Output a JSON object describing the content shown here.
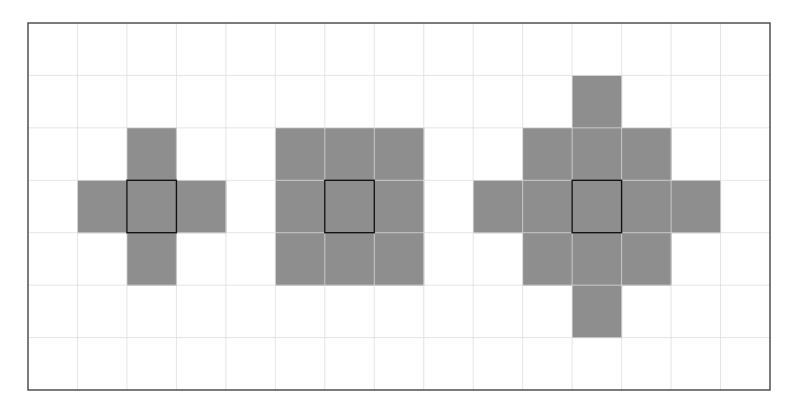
{
  "diagram": {
    "title": "",
    "grid": {
      "columns": 15,
      "rows": 7
    },
    "colors": {
      "background": "#ffffff",
      "grid_line": "#dcdcdc",
      "border": "#444444",
      "filled_cell": "#8e8e8e",
      "center_outline": "#111111"
    },
    "shapes": [
      {
        "name": "cross-neighborhood",
        "description": "4-neighborhood (Manhattan distance 1)",
        "center": {
          "col": 2,
          "row": 3
        },
        "cells": [
          [
            2,
            2
          ],
          [
            1,
            3
          ],
          [
            2,
            3
          ],
          [
            3,
            3
          ],
          [
            2,
            4
          ]
        ]
      },
      {
        "name": "square-neighborhood",
        "description": "8-neighborhood (Chebyshev distance 1)",
        "center": {
          "col": 6,
          "row": 3
        },
        "cells": [
          [
            5,
            2
          ],
          [
            6,
            2
          ],
          [
            7,
            2
          ],
          [
            5,
            3
          ],
          [
            6,
            3
          ],
          [
            7,
            3
          ],
          [
            5,
            4
          ],
          [
            6,
            4
          ],
          [
            7,
            4
          ]
        ]
      },
      {
        "name": "diamond-neighborhood",
        "description": "Manhattan distance 2",
        "center": {
          "col": 11,
          "row": 3
        },
        "cells": [
          [
            11,
            1
          ],
          [
            10,
            2
          ],
          [
            11,
            2
          ],
          [
            12,
            2
          ],
          [
            9,
            3
          ],
          [
            10,
            3
          ],
          [
            11,
            3
          ],
          [
            12,
            3
          ],
          [
            13,
            3
          ],
          [
            10,
            4
          ],
          [
            11,
            4
          ],
          [
            12,
            4
          ],
          [
            11,
            5
          ]
        ]
      }
    ]
  }
}
